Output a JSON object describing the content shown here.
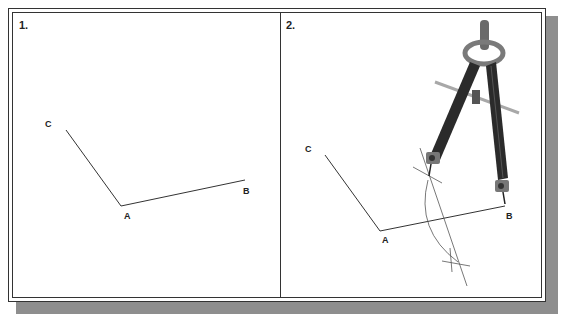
{
  "figure": {
    "panels": [
      {
        "label": "1.",
        "points": {
          "A": "A",
          "B": "B",
          "C": "C"
        },
        "description": "Angle CAB with vertex A"
      },
      {
        "label": "2.",
        "points": {
          "A": "A",
          "B": "B",
          "C": "C"
        },
        "description": "Compass drawing intersecting arcs to bisect line AB"
      }
    ],
    "colors": {
      "line": "#333333",
      "frame": "#333333",
      "shadow": "#8e8e8e",
      "compass_dark": "#2b2b2b",
      "compass_mid": "#6a6a6a",
      "compass_light": "#a8a8a8"
    }
  }
}
